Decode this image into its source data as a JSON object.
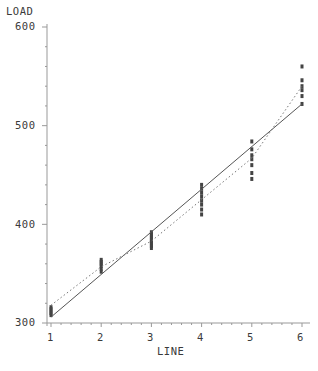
{
  "chart_data": {
    "type": "scatter",
    "title": "",
    "xlabel": "LINE",
    "ylabel": "LOAD",
    "xlim": [
      1,
      6
    ],
    "ylim": [
      300,
      600
    ],
    "x_ticks": [
      "1",
      "2",
      "3",
      "4",
      "5",
      "6"
    ],
    "y_ticks": [
      "300",
      "400",
      "500",
      "600"
    ],
    "grid": false,
    "legend": null,
    "series": [
      {
        "name": "observations",
        "style": "scatter",
        "points": [
          {
            "x": 1,
            "y": [
              308,
              310,
              312,
              314,
              316
            ]
          },
          {
            "x": 2,
            "y": [
              352,
              355,
              358,
              360,
              362,
              364
            ]
          },
          {
            "x": 3,
            "y": [
              376,
              378,
              380,
              382,
              384,
              386,
              388,
              390,
              392
            ]
          },
          {
            "x": 4,
            "y": [
              410,
              415,
              420,
              424,
              428,
              432,
              436,
              440
            ]
          },
          {
            "x": 5,
            "y": [
              446,
              452,
              460,
              466,
              470,
              476,
              484
            ]
          },
          {
            "x": 6,
            "y": [
              522,
              530,
              536,
              540,
              546,
              560
            ]
          }
        ]
      },
      {
        "name": "linear fit",
        "style": "solid-line",
        "x": [
          1,
          6
        ],
        "values": [
          306,
          522
        ]
      },
      {
        "name": "group means",
        "style": "dotted-line",
        "x": [
          1,
          2,
          3,
          4,
          5,
          6
        ],
        "values": [
          318,
          357,
          383,
          425,
          467,
          540
        ]
      }
    ]
  },
  "axes": {
    "y_title": "LOAD",
    "x_title": "LINE"
  }
}
